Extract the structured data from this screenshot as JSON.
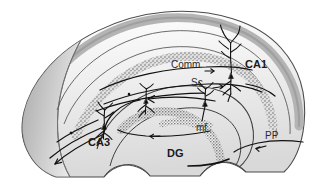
{
  "figure": {
    "background_color": "#ffffff",
    "width": 315,
    "height": 193
  },
  "palette": {
    "outline_stroke": "#3c3c3c",
    "inner_stroke": "#555555",
    "tissue_light": "#f2f2f2",
    "tissue_mid": "#e2e2e2",
    "tissue_dark": "#bdbdbd",
    "tissue_darkest": "#a6a6a6",
    "cell_layer_stipple": "#6e6e6e",
    "pathway_stroke": "#111111",
    "label_color": "#1a1a1a"
  },
  "labels": {
    "ca1": {
      "text": "CA1",
      "x": 245,
      "y": 68,
      "size": 11,
      "bold": true
    },
    "ca3": {
      "text": "CA3",
      "x": 88,
      "y": 146,
      "size": 11,
      "bold": true
    },
    "dg": {
      "text": "DG",
      "x": 167,
      "y": 157,
      "size": 11,
      "bold": true
    },
    "comm": {
      "text": "Comm",
      "x": 171,
      "y": 68,
      "size": 10,
      "bold": false
    },
    "sc": {
      "text": "Sc",
      "x": 191,
      "y": 86,
      "size": 10,
      "bold": false
    },
    "mf": {
      "text": "mf",
      "x": 196,
      "y": 131,
      "size": 10,
      "bold": false
    },
    "pp": {
      "text": "PP",
      "x": 265,
      "y": 139,
      "size": 10,
      "bold": false
    }
  },
  "legend_meanings": {
    "CA1": "Cornu Ammonis area 1 pyramidal cell field",
    "CA3": "Cornu Ammonis area 3 pyramidal cell field",
    "DG": "Dentate gyrus granule cell layer",
    "Comm": "Commissural fibers",
    "Sc": "Schaffer collaterals",
    "mf": "Mossy fibers",
    "PP": "Perforant path"
  },
  "neurons": [
    {
      "name": "ca1-pyramidal-neuron",
      "soma_x": 232,
      "soma_y": 76
    },
    {
      "name": "ca3-pyramidal-neuron",
      "soma_x": 104,
      "soma_y": 127
    },
    {
      "name": "dg-granule-neuron",
      "soma_x": 205,
      "soma_y": 104
    },
    {
      "name": "hilar-neuron",
      "soma_x": 146,
      "soma_y": 101
    }
  ],
  "pathways": [
    {
      "name": "commissural-pathway",
      "label": "Comm",
      "direction": "rightward"
    },
    {
      "name": "schaffer-collateral-pathway",
      "label": "Sc",
      "direction": "rightward"
    },
    {
      "name": "mossy-fiber-pathway",
      "label": "mf",
      "direction": "leftward"
    },
    {
      "name": "perforant-path",
      "label": "PP",
      "direction": "leftward-inward"
    },
    {
      "name": "fimbria-output-fibers",
      "label": "",
      "direction": "leftward"
    }
  ]
}
